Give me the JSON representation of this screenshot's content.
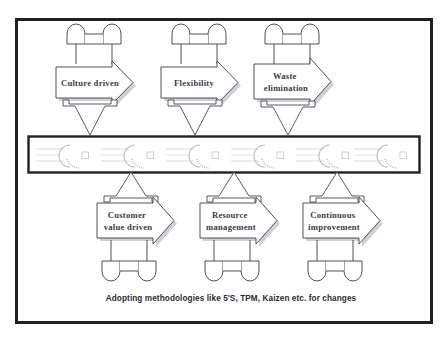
{
  "diagram": {
    "frame": {
      "border_color": "#231f20",
      "background_color": "#ffffff"
    },
    "colors": {
      "outline": "#3c3c46",
      "text": "#3a3a44",
      "caption_text": "#2a2a33",
      "bar_border": "#231f20",
      "bar_pattern": "#c9c9d2",
      "shadow": "#9a9aa4",
      "fill": "#ffffff"
    },
    "top_row": [
      {
        "id": "culture-driven",
        "label_lines": [
          "Culture driven"
        ],
        "has_cylinder_above": true,
        "has_arrow_below": true
      },
      {
        "id": "flexibility",
        "label_lines": [
          "Flexibility"
        ],
        "has_cylinder_above": true,
        "has_arrow_below": true
      },
      {
        "id": "waste-elimination",
        "label_lines": [
          "Waste",
          "elimination"
        ],
        "has_cylinder_above": true,
        "has_arrow_below": true
      }
    ],
    "bottom_row": [
      {
        "id": "customer-value-driven",
        "label_lines": [
          "Customer",
          "value driven"
        ],
        "has_arrow_above": true,
        "has_cylinder_below": true
      },
      {
        "id": "resource-management",
        "label_lines": [
          "Resource",
          "management"
        ],
        "has_arrow_above": true,
        "has_cylinder_below": true
      },
      {
        "id": "continuous-improvement",
        "label_lines": [
          "Continuous",
          "improvement"
        ],
        "has_arrow_above": true,
        "has_cylinder_below": true
      }
    ],
    "center_bar": {
      "id": "center-conveyor-bar",
      "label": "",
      "pattern_repeats": 6
    },
    "caption": "Adopting methodologies like 5'S, TPM, Kaizen etc. for changes"
  }
}
